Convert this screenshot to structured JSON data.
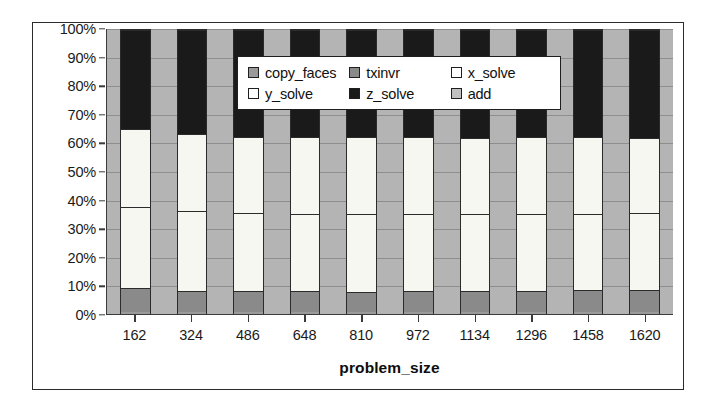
{
  "chart_data": {
    "type": "bar",
    "subtype": "100% stacked column",
    "title": "",
    "xlabel": "problem_size",
    "ylabel": "",
    "ylim": [
      0,
      100
    ],
    "y_unit": "%",
    "grid": true,
    "legend_position": "inside-top-center",
    "categories": [
      "162",
      "324",
      "486",
      "648",
      "810",
      "972",
      "1134",
      "1296",
      "1458",
      "1620"
    ],
    "y_ticks": [
      "0%",
      "10%",
      "20%",
      "30%",
      "40%",
      "50%",
      "60%",
      "70%",
      "80%",
      "90%",
      "100%"
    ],
    "y_tick_values": [
      0,
      10,
      20,
      30,
      40,
      50,
      60,
      70,
      80,
      90,
      100
    ],
    "stack_order_bottom_to_top": [
      "copy_faces",
      "txinvr",
      "y_solve",
      "x_solve",
      "z_solve",
      "add"
    ],
    "series": [
      {
        "name": "copy_faces",
        "color": "#9a9a9a",
        "values": [
          0.6,
          0.6,
          0.6,
          0.6,
          0.6,
          0.6,
          0.6,
          0.6,
          0.6,
          0.6
        ]
      },
      {
        "name": "txinvr",
        "color": "#8a8a8a",
        "values": [
          8.5,
          7.6,
          7.5,
          7.6,
          7.2,
          7.6,
          7.6,
          7.6,
          7.8,
          8.0
        ]
      },
      {
        "name": "y_solve",
        "color": "#f7f7f2",
        "values": [
          28.4,
          27.8,
          27.2,
          27.0,
          27.4,
          26.9,
          26.8,
          26.8,
          26.7,
          27.0
        ]
      },
      {
        "name": "x_solve",
        "color": "#f7f7f2",
        "values": [
          27.5,
          27.0,
          26.7,
          26.8,
          26.8,
          26.9,
          26.9,
          27.0,
          27.0,
          26.1
        ]
      },
      {
        "name": "z_solve",
        "color": "#1a1a1a",
        "values": [
          34.5,
          36.5,
          37.5,
          37.5,
          37.5,
          37.5,
          37.6,
          37.5,
          37.4,
          37.8
        ]
      },
      {
        "name": "add",
        "color": "#c0c0c0",
        "values": [
          0.5,
          0.5,
          0.5,
          0.5,
          0.5,
          0.5,
          0.5,
          0.5,
          0.5,
          0.5
        ]
      }
    ],
    "plot_background": "#b4b4b4",
    "gridline_color": "#8e8e8e",
    "border_color": "#2b2b2b"
  },
  "legend": {
    "items": [
      {
        "label": "copy_faces",
        "color": "#9a9a9a"
      },
      {
        "label": "txinvr",
        "color": "#8a8a8a"
      },
      {
        "label": "x_solve",
        "color": "#ffffff"
      },
      {
        "label": "y_solve",
        "color": "#ffffff"
      },
      {
        "label": "z_solve",
        "color": "#1a1a1a"
      },
      {
        "label": "add",
        "color": "#c0c0c0"
      }
    ]
  },
  "axis": {
    "x_title": "problem_size"
  }
}
